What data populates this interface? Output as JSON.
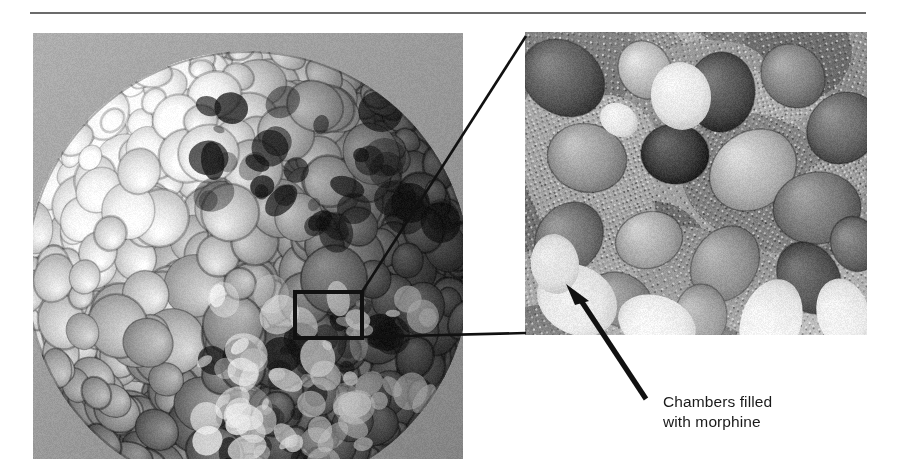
{
  "figure": {
    "divider": {
      "color": "#6b6b6b"
    },
    "main_image": {
      "alt": "Scanning electron micrograph of a spherical multi-chambered microparticle",
      "icon": "sem-sphere-image"
    },
    "inset_image": {
      "alt": "Magnified scanning electron micrograph of the chamber region",
      "icon": "sem-magnified-image"
    },
    "callout": {
      "box_label": "magnification-region",
      "leader_label": "magnification-leader-line"
    },
    "annotation": {
      "text": "Chambers filled\nwith morphine",
      "line1": "Chambers filled",
      "line2": "with morphine",
      "arrow_label": "annotation-arrow",
      "color": "#1a1a1a"
    }
  },
  "chart_data": {
    "type": "table",
    "title": "",
    "panels": [
      {
        "name": "main",
        "kind": "micrograph",
        "x": 33,
        "y": 33,
        "width": 430,
        "height": 426
      },
      {
        "name": "inset",
        "kind": "micrograph-magnified",
        "x": 525,
        "y": 32,
        "width": 342,
        "height": 303
      }
    ],
    "annotations": [
      {
        "label": "Chambers filled with morphine",
        "arrow_from": [
          640,
          400
        ],
        "arrow_to": [
          568,
          288
        ]
      }
    ],
    "callout_box": {
      "x": 295,
      "y": 292,
      "width": 67,
      "height": 46
    },
    "leader_lines": [
      {
        "from": [
          362,
          292
        ],
        "to": [
          525,
          36
        ]
      },
      {
        "from": [
          362,
          337
        ],
        "to": [
          525,
          333
        ]
      }
    ]
  }
}
